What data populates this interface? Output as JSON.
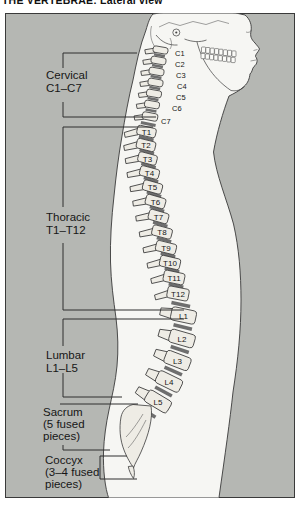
{
  "title": "THE VERTEBRAE: Lateral view",
  "colors": {
    "panel_bg": "#b5b7b3",
    "body_fill": "#f6f6f3",
    "bone_fill": "#eeece5",
    "disc": "#6e6e6e",
    "line": "#3a3a3a",
    "text": "#161616"
  },
  "figure": {
    "regions": [
      {
        "id": "cervical",
        "lines": [
          "Cervical",
          "C1–C7"
        ],
        "tx": 46,
        "ty": 79,
        "brackets": [
          [
            [
              137,
              53
            ],
            [
              63,
              53
            ],
            [
              63,
              68
            ]
          ],
          [
            [
              63,
              102
            ],
            [
              63,
              117
            ],
            [
              156,
              117
            ]
          ]
        ]
      },
      {
        "id": "thoracic",
        "lines": [
          "Thoracic",
          "T1–T12"
        ],
        "tx": 46,
        "ty": 221,
        "brackets": [
          [
            [
              153,
              127
            ],
            [
              63,
              127
            ],
            [
              63,
              207
            ]
          ],
          [
            [
              63,
              243
            ],
            [
              63,
              310
            ],
            [
              184,
              310
            ]
          ]
        ]
      },
      {
        "id": "lumbar",
        "lines": [
          "Lumbar",
          "L1–L5"
        ],
        "tx": 46,
        "ty": 359,
        "brackets": [
          [
            [
              184,
              319
            ],
            [
              63,
              319
            ],
            [
              63,
              346
            ]
          ],
          [
            [
              63,
              373
            ],
            [
              63,
              397
            ],
            [
              122,
              397
            ]
          ]
        ]
      },
      {
        "id": "sacrum",
        "lines": [
          "Sacrum",
          "(5 fused",
          "pieces)"
        ],
        "tx": 43,
        "ty": 416,
        "brackets": [
          [
            [
              60,
              404
            ],
            [
              138,
              404
            ]
          ],
          [
            [
              63,
              445
            ],
            [
              63,
              450
            ],
            [
              110,
              450
            ]
          ]
        ]
      },
      {
        "id": "coccyx",
        "lines": [
          "Coccyx",
          "(3–4 fused",
          "pieces)"
        ],
        "tx": 45,
        "ty": 464,
        "brackets": [
          [
            [
              127,
              456
            ],
            [
              100,
              456
            ],
            [
              100,
              479
            ],
            [
              137,
              479
            ]
          ]
        ]
      }
    ],
    "vertebrae": [
      {
        "label": "C1",
        "t": "C",
        "x": 160.5,
        "y": 50,
        "w": 15,
        "h": 6.5,
        "a": 10,
        "lx": 175,
        "ly": 56
      },
      {
        "label": "C2",
        "t": "C",
        "x": 158.5,
        "y": 60.5,
        "w": 15,
        "h": 7,
        "a": 10,
        "lx": 175,
        "ly": 67
      },
      {
        "label": "C3",
        "t": "C",
        "x": 156.5,
        "y": 71.5,
        "w": 15,
        "h": 7,
        "a": 10,
        "lx": 176,
        "ly": 78
      },
      {
        "label": "C4",
        "t": "C",
        "x": 155.5,
        "y": 82.5,
        "w": 15,
        "h": 7,
        "a": 10,
        "lx": 177,
        "ly": 89
      },
      {
        "label": "C5",
        "t": "C",
        "x": 154,
        "y": 93.5,
        "w": 15,
        "h": 7,
        "a": 10,
        "lx": 176,
        "ly": 100
      },
      {
        "label": "C6",
        "t": "C",
        "x": 152,
        "y": 104.5,
        "w": 15,
        "h": 7,
        "a": 10,
        "lx": 172,
        "ly": 110.5
      },
      {
        "label": "C7",
        "t": "C",
        "x": 150,
        "y": 116.5,
        "w": 15.5,
        "h": 7.5,
        "a": 11,
        "lx": 161,
        "ly": 123.5
      },
      {
        "label": "T1",
        "t": "T",
        "x": 146.5,
        "y": 131.5,
        "w": 19,
        "h": 9.5,
        "a": 13
      },
      {
        "label": "T2",
        "t": "T",
        "x": 146,
        "y": 145,
        "w": 19,
        "h": 10,
        "a": 14
      },
      {
        "label": "T3",
        "t": "T",
        "x": 147.5,
        "y": 158.5,
        "w": 19,
        "h": 10,
        "a": 15
      },
      {
        "label": "T4",
        "t": "T",
        "x": 149.5,
        "y": 172.5,
        "w": 19.5,
        "h": 10,
        "a": 15
      },
      {
        "label": "T5",
        "t": "T",
        "x": 152.5,
        "y": 187,
        "w": 19.5,
        "h": 10.5,
        "a": 16
      },
      {
        "label": "T6",
        "t": "T",
        "x": 155.5,
        "y": 201.5,
        "w": 20,
        "h": 10.5,
        "a": 16
      },
      {
        "label": "T7",
        "t": "T",
        "x": 158.5,
        "y": 216.5,
        "w": 20,
        "h": 10.5,
        "a": 16
      },
      {
        "label": "T8",
        "t": "T",
        "x": 162,
        "y": 232,
        "w": 20,
        "h": 10.5,
        "a": 15
      },
      {
        "label": "T9",
        "t": "T",
        "x": 166,
        "y": 247.5,
        "w": 20.5,
        "h": 10.5,
        "a": 14
      },
      {
        "label": "T10",
        "t": "T",
        "x": 170,
        "y": 262.5,
        "w": 20.5,
        "h": 11,
        "a": 13
      },
      {
        "label": "T11",
        "t": "T",
        "x": 174,
        "y": 277.5,
        "w": 21,
        "h": 11.5,
        "a": 12
      },
      {
        "label": "T12",
        "t": "T",
        "x": 178,
        "y": 293.5,
        "w": 21.5,
        "h": 12,
        "a": 11
      },
      {
        "label": "L1",
        "t": "L",
        "x": 183.5,
        "y": 315.5,
        "w": 25,
        "h": 13.5,
        "a": 12
      },
      {
        "label": "L2",
        "t": "L",
        "x": 182,
        "y": 338.5,
        "w": 25.5,
        "h": 13.5,
        "a": 16
      },
      {
        "label": "L3",
        "t": "L",
        "x": 177.5,
        "y": 360.5,
        "w": 26,
        "h": 13.5,
        "a": 21
      },
      {
        "label": "L4",
        "t": "L",
        "x": 169,
        "y": 381.5,
        "w": 26,
        "h": 13.5,
        "a": 26
      },
      {
        "label": "L5",
        "t": "L",
        "x": 158,
        "y": 401.5,
        "w": 26,
        "h": 13.5,
        "a": 31
      }
    ]
  }
}
